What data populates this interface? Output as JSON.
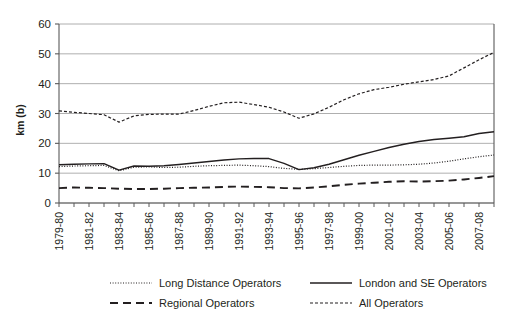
{
  "chart_data": {
    "type": "line",
    "title": "",
    "xlabel": "",
    "ylabel": "km (b)",
    "ylim": [
      0,
      60
    ],
    "yticks": [
      0,
      10,
      20,
      30,
      40,
      50,
      60
    ],
    "grid": true,
    "legend_position": "bottom",
    "x": [
      "1979-80",
      "1980-81",
      "1981-82",
      "1982-83",
      "1983-84",
      "1984-85",
      "1985-86",
      "1986-87",
      "1987-88",
      "1988-89",
      "1989-90",
      "1990-91",
      "1991-92",
      "1992-93",
      "1993-94",
      "1994-95",
      "1995-96",
      "1996-97",
      "1997-98",
      "1998-99",
      "1999-00",
      "2000-01",
      "2001-02",
      "2002-03",
      "2003-04",
      "2004-05",
      "2005-06",
      "2006-07",
      "2007-08",
      "2008-09"
    ],
    "xtick_labels": [
      "1979-80",
      "1981-82",
      "1983-84",
      "1985-86",
      "1987-88",
      "1989-90",
      "1991-92",
      "1993-94",
      "1995-96",
      "1997-98",
      "1999-00",
      "2001-02",
      "2003-04",
      "2005-06",
      "2007-08"
    ],
    "series": [
      {
        "name": "Long Distance Operators",
        "style": "dotted",
        "values": [
          12.2,
          12.4,
          12.5,
          12.6,
          10.8,
          12.0,
          12.1,
          11.9,
          12.0,
          12.3,
          12.5,
          12.6,
          12.7,
          12.5,
          12.2,
          11.6,
          11.3,
          11.5,
          11.9,
          12.3,
          12.6,
          12.7,
          12.7,
          12.8,
          13.0,
          13.4,
          14.0,
          14.8,
          15.5,
          16.1
        ]
      },
      {
        "name": "London and SE Operators",
        "style": "solid",
        "values": [
          12.8,
          13.0,
          13.1,
          13.2,
          11.0,
          12.4,
          12.3,
          12.5,
          12.9,
          13.4,
          13.9,
          14.4,
          14.8,
          14.9,
          14.9,
          13.3,
          11.2,
          11.8,
          13.0,
          14.5,
          16.0,
          17.3,
          18.6,
          19.7,
          20.6,
          21.3,
          21.7,
          22.2,
          23.3,
          23.9
        ]
      },
      {
        "name": "Regional Operators",
        "style": "dashed-long",
        "values": [
          5.0,
          5.2,
          5.1,
          5.0,
          4.8,
          4.7,
          4.7,
          4.8,
          5.0,
          5.1,
          5.2,
          5.4,
          5.5,
          5.4,
          5.3,
          5.0,
          4.9,
          5.2,
          5.6,
          6.1,
          6.5,
          6.8,
          7.1,
          7.3,
          7.2,
          7.3,
          7.5,
          7.9,
          8.4,
          9.0
        ]
      },
      {
        "name": "All Operators",
        "style": "dashed-short",
        "values": [
          30.9,
          30.4,
          30.0,
          29.6,
          27.1,
          29.2,
          29.7,
          29.8,
          29.8,
          31.0,
          32.4,
          33.6,
          33.8,
          33.0,
          32.1,
          30.5,
          28.4,
          29.9,
          32.1,
          34.6,
          36.6,
          38.0,
          38.8,
          39.8,
          40.6,
          41.4,
          42.6,
          45.3,
          48.0,
          50.5
        ]
      }
    ]
  },
  "legend": {
    "items": [
      {
        "label": "Long Distance Operators",
        "style": "dotted"
      },
      {
        "label": "London and SE Operators",
        "style": "solid"
      },
      {
        "label": "Regional Operators",
        "style": "dashed-long"
      },
      {
        "label": "All Operators",
        "style": "dashed-short"
      }
    ]
  },
  "axis": {
    "y_title": "km (b)"
  },
  "colors": {
    "line": "#231f20",
    "grid": "#9a9a9a",
    "axis": "#595959",
    "background": "#ffffff"
  }
}
